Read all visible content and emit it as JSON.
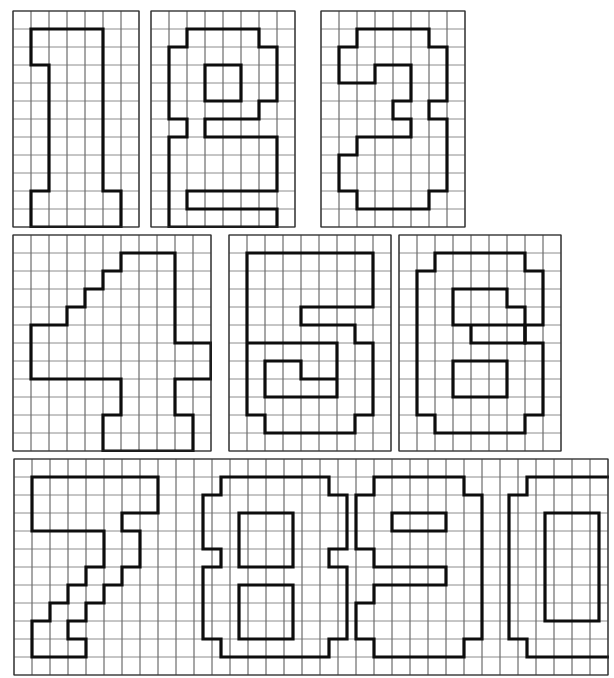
{
  "document": {
    "title": "Grid-Paper Block Digits 0-9",
    "description": "Worksheet of the ten decimal digits drawn as outlined pixel shapes on square graph paper.",
    "background_color": "#ffffff",
    "grid_color": "#3a3a3a",
    "stroke_color": "#0d0d0d",
    "cell_size": 18
  },
  "rows": [
    {
      "name": "row-top",
      "y": 8,
      "panels": [
        "digit-1",
        "digit-2",
        "digit-3"
      ]
    },
    {
      "name": "row-middle",
      "y": 232,
      "panels": [
        "digit-4",
        "digit-5",
        "digit-6"
      ]
    },
    {
      "name": "row-bottom",
      "y": 458,
      "panels": [
        "digits-7890"
      ]
    }
  ],
  "panels": [
    {
      "id": "digit-1",
      "label": "1",
      "x": 12,
      "y": 10,
      "cols": 7,
      "rows": 12,
      "outline": [
        [
          1,
          1
        ],
        [
          5,
          1
        ],
        [
          5,
          10
        ],
        [
          6,
          10
        ],
        [
          6,
          12
        ],
        [
          1,
          12
        ],
        [
          1,
          10
        ],
        [
          2,
          10
        ],
        [
          2,
          3
        ],
        [
          1,
          3
        ]
      ]
    },
    {
      "id": "digit-2",
      "label": "2",
      "x": 150,
      "y": 10,
      "cols": 8,
      "rows": 12,
      "outline": [
        [
          2,
          1
        ],
        [
          6,
          1
        ],
        [
          6,
          2
        ],
        [
          7,
          2
        ],
        [
          7,
          5
        ],
        [
          6,
          5
        ],
        [
          6,
          6
        ],
        [
          3,
          6
        ],
        [
          3,
          7
        ],
        [
          7,
          7
        ],
        [
          7,
          10
        ],
        [
          2,
          10
        ],
        [
          2,
          11
        ],
        [
          7,
          11
        ],
        [
          7,
          12
        ],
        [
          1,
          12
        ],
        [
          1,
          6
        ],
        [
          2,
          6
        ],
        [
          2,
          7
        ],
        [
          1,
          7
        ],
        [
          1,
          2
        ],
        [
          2,
          2
        ],
        [
          2,
          5
        ],
        [
          3,
          5
        ],
        [
          3,
          3
        ],
        [
          5,
          3
        ],
        [
          5,
          5
        ],
        [
          6,
          5
        ],
        [
          6,
          2
        ],
        [
          2,
          2
        ]
      ],
      "paths": [
        "M2,1 L6,1 L6,2 L7,2 L7,5 L6,5 L6,6 L3,6 L3,7 L7,7 L7,10 L2,10 L2,11 L7,11 L7,12 L1,12 L1,7 L2,7 L2,6 L1,6 L1,2 L2,2 Z",
        "M3,3 L5,3 L5,5 L3,5 Z"
      ]
    },
    {
      "id": "digit-3",
      "label": "3",
      "x": 320,
      "y": 10,
      "cols": 8,
      "rows": 12,
      "paths": [
        "M2,1 L6,1 L6,2 L7,2 L7,5 L6,5 L6,6 L7,6 L7,10 L6,10 L6,11 L2,11 L2,10 L1,10 L1,7 L2,7 L2,6 L4,6 L4,5 L3,5 L3,4 L5,4 L5,3 L3,3 L3,4 L1,4 L1,2 L2,2 Z"
      ]
    },
    {
      "id": "digit-4",
      "label": "4",
      "x": 12,
      "y": 234,
      "cols": 11,
      "rows": 12,
      "paths": [
        "M6,1 L9,1 L9,6 L11,6 L11,8 L9,8 L9,10 L10,10 L10,12 L5,12 L5,10 L6,10 L6,8 L1,8 L1,5 L3,5 L3,4 L4,4 L4,3 L5,3 L5,2 L6,2 Z"
      ]
    },
    {
      "id": "digit-5",
      "label": "5",
      "x": 228,
      "y": 234,
      "cols": 9,
      "rows": 12,
      "paths": [
        "M1,1 L8,1 L8,4 L4,4 L4,5 L7,5 L7,6 L8,6 L8,10 L7,10 L7,11 L2,11 L2,10 L1,10 L1,6 L6,6 L6,8 L4,8 L4,7 L2,7 L2,9 L6,9 Z"
      ]
    },
    {
      "id": "digit-6",
      "label": "6",
      "x": 398,
      "y": 234,
      "cols": 9,
      "rows": 12,
      "paths": [
        "M2,1 L7,1 L7,2 L8,2 L8,5 L7,5 L7,6 L8,6 L8,10 L7,10 L7,11 L2,11 L2,10 L1,10 L1,2 L2,2 Z",
        "M3,3 L6,3 L6,4 L4,4 L4,6 L7,6 L7,5 L3,5 Z",
        "M3,7 L6,7 L6,9 L3,9 Z"
      ]
    },
    {
      "id": "digits-7890",
      "label": "7 8 9 0",
      "x": 13,
      "y": 458,
      "cols": 33,
      "rows": 12,
      "glyphs": [
        {
          "digit": "7",
          "paths": [
            "M1,1 L8,1 L8,4 L9,4 L9,5 L7,5 L7,4 L6,4 L6,3 L1,3 Z"
          ]
        },
        {
          "digit": "8",
          "paths": [
            "M3,1 L9,1 L9,2 L10,2 L10,4 L9,4 L9,5 L10,5 L10,9 L9,9 L9,10 L3,10 L3,9 L2,9 L2,5 L3,5 L3,4 L2,4 L2,2 L3,2 Z"
          ]
        },
        {
          "digit": "9",
          "paths": [
            "M3,1 L8,1 L8,2 L9,2 L9,10 L8,10 L8,11 L3,11 L3,10 L2,10 L2,8 L3,8 L3,7 L7,7 L7,5 L3,5 L3,4 L2,4 L2,2 L3,2 Z"
          ]
        },
        {
          "digit": "0",
          "paths": [
            "M2,1 L7,1 L7,2 L8,2 L8,10 L7,10 L7,11 L2,11 L2,10 L1,10 L1,2 L2,2 Z"
          ]
        }
      ]
    }
  ]
}
